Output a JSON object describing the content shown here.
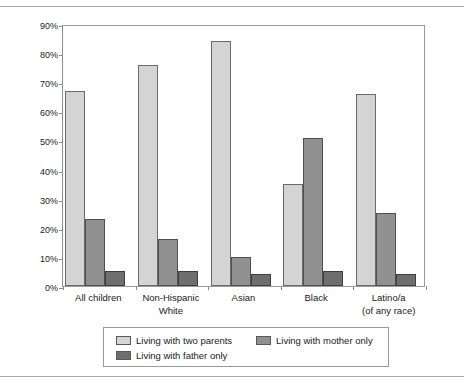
{
  "chart_data": {
    "type": "bar",
    "title": "",
    "subtitle": "",
    "xlabel": "",
    "ylabel": "Percentage distribution of family composition",
    "ylim": [
      0,
      90
    ],
    "ytick_step": 10,
    "ytick_labels": [
      "0%",
      "10%",
      "20%",
      "30%",
      "40%",
      "50%",
      "60%",
      "70%",
      "80%",
      "90%"
    ],
    "ytick_values": [
      0,
      10,
      20,
      30,
      40,
      50,
      60,
      70,
      80,
      90
    ],
    "grid": false,
    "legend_position": "bottom",
    "categories": [
      "All children",
      "Non-Hispanic\nWhite",
      "Asian",
      "Black",
      "Latino/a\n(of any race)"
    ],
    "category_lines": [
      [
        "All children"
      ],
      [
        "Non-Hispanic",
        "White"
      ],
      [
        "Asian"
      ],
      [
        "Black"
      ],
      [
        "Latino/a",
        "(of any race)"
      ]
    ],
    "series": [
      {
        "name": "Living with two parents",
        "color": "#d4d4d4",
        "values": [
          67,
          76,
          84,
          35,
          66
        ]
      },
      {
        "name": "Living with mother only",
        "color": "#919191",
        "values": [
          23,
          16,
          10,
          51,
          25
        ]
      },
      {
        "name": "Living with father only",
        "color": "#6e6e6e",
        "values": [
          5,
          5,
          4,
          5,
          4
        ]
      }
    ]
  },
  "legend": {
    "entries": [
      {
        "label": "Living with two parents",
        "color": "#d4d4d4"
      },
      {
        "label": "Living with mother only",
        "color": "#919191"
      },
      {
        "label": "Living with father only",
        "color": "#6e6e6e"
      }
    ]
  }
}
